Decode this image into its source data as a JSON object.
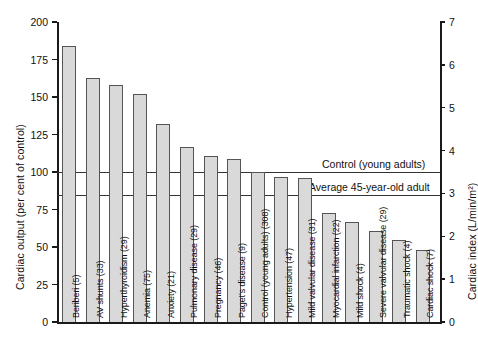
{
  "chart_data": {
    "type": "bar",
    "title": "",
    "subtitle": "",
    "xlabel": "",
    "ylabel": "Cardiac output (per cent of control)",
    "y2label": "Cardiac index (L/min/m²)",
    "ylim": [
      0,
      200
    ],
    "y2lim": [
      0,
      7
    ],
    "yticks": [
      "0",
      "25",
      "50",
      "75",
      "100",
      "125",
      "150",
      "175",
      "200"
    ],
    "y2ticks": [
      "0",
      "1",
      "2",
      "3",
      "4",
      "5",
      "6",
      "7"
    ],
    "grid": false,
    "legend": "none",
    "categories": [
      "Beriberi (5)",
      "AV shunts (33)",
      "Hyperthyroidism (29)",
      "Anemia (75)",
      "Anxiety (21)",
      "Pulmonary disease (29)",
      "Pregnancy (46)",
      "Paget's disease (9)",
      "Control (young adults) (308)",
      "Hypertension (47)",
      "Mild valvular disease (31)",
      "Myocardial infarction (22)",
      "Mild shock (4)",
      "Severe valvular disease (29)",
      "Traumatic shock (4)",
      "Cardiac shock (7)"
    ],
    "values": [
      184,
      163,
      158,
      152,
      132,
      117,
      111,
      109,
      100,
      97,
      96,
      73,
      67,
      61,
      55,
      48
    ],
    "reference_lines": [
      {
        "label": "Control (young adults)",
        "value": 100
      },
      {
        "label": "Average 45-year-old adult",
        "value": 85
      }
    ],
    "colors": {
      "bar_fill": "#d9d9d9",
      "bar_stroke": "#555555",
      "axis": "#1a1a1a",
      "reference_line": "#333333",
      "background": "#ffffff"
    }
  }
}
